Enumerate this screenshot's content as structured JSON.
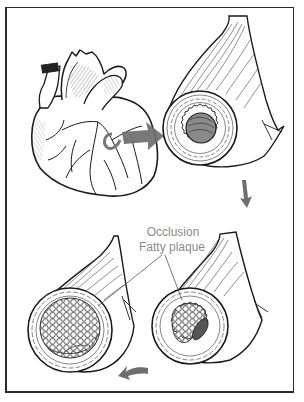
{
  "figure": {
    "panels": [
      {
        "id": "heart",
        "label": "Heart with coronary arteries"
      },
      {
        "id": "healthy-artery",
        "label": "Artery cross-section (open lumen)"
      },
      {
        "id": "narrowed-artery",
        "label": "Artery with fatty plaque (narrowed lumen)"
      },
      {
        "id": "occluded-artery",
        "label": "Artery fully occluded by fatty plaque"
      }
    ],
    "labels": {
      "occlusion": "Occlusion",
      "fatty_plaque": "Fatty plaque"
    },
    "arrows": [
      {
        "from": "heart",
        "to": "healthy-artery",
        "direction": "right"
      },
      {
        "from": "healthy-artery",
        "to": "narrowed-artery",
        "direction": "down"
      },
      {
        "from": "narrowed-artery",
        "to": "occluded-artery",
        "direction": "left"
      }
    ],
    "colors": {
      "line": "#1a1a1a",
      "arrow": "#6e6e6e",
      "label_text": "#8a8a8a",
      "lumen_shade": "#7a7a7a",
      "background": "#ffffff"
    }
  }
}
